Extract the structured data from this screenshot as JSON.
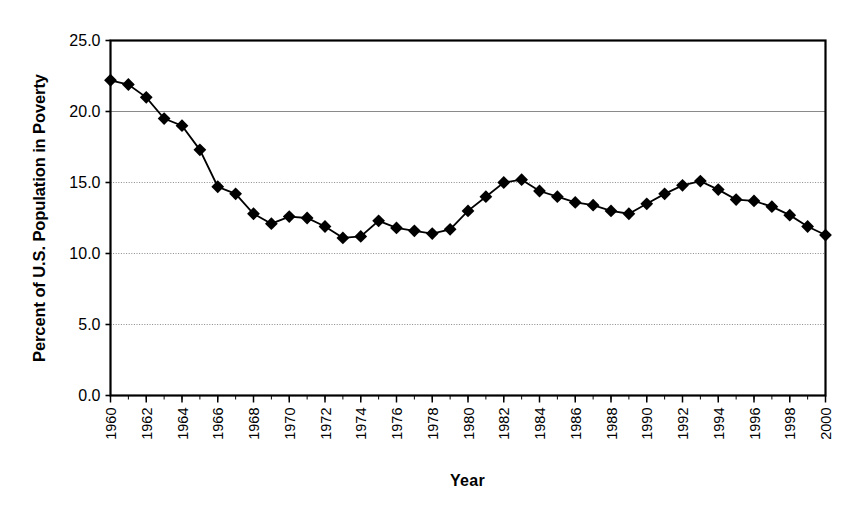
{
  "chart_data": {
    "type": "line",
    "title": "",
    "xlabel": "Year",
    "ylabel": "Percent of U.S. Population in Poverty",
    "xlim": [
      1960,
      2000
    ],
    "ylim": [
      0.0,
      25.0
    ],
    "ytick_labels": [
      "0.0",
      "5.0",
      "10.0",
      "15.0",
      "20.0",
      "25.0"
    ],
    "ytick_values": [
      0.0,
      5.0,
      10.0,
      15.0,
      20.0,
      25.0
    ],
    "xtick_labels": [
      "1960",
      "1962",
      "1964",
      "1966",
      "1968",
      "1970",
      "1972",
      "1974",
      "1976",
      "1978",
      "1980",
      "1982",
      "1984",
      "1986",
      "1988",
      "1990",
      "1992",
      "1994",
      "1996",
      "1998",
      "2000"
    ],
    "xtick_label_rotation": -90,
    "minor_xticks_every": 1,
    "grid": "horizontal",
    "legend": "none",
    "marker": "diamond",
    "marker_color": "#000000",
    "line_color": "#000000",
    "x": [
      1960,
      1961,
      1962,
      1963,
      1964,
      1965,
      1966,
      1967,
      1968,
      1969,
      1970,
      1971,
      1972,
      1973,
      1974,
      1975,
      1976,
      1977,
      1978,
      1979,
      1980,
      1981,
      1982,
      1983,
      1984,
      1985,
      1986,
      1987,
      1988,
      1989,
      1990,
      1991,
      1992,
      1993,
      1994,
      1995,
      1996,
      1997,
      1998,
      1999,
      2000
    ],
    "values": [
      22.2,
      21.9,
      21.0,
      19.5,
      19.0,
      17.3,
      14.7,
      14.2,
      12.8,
      12.1,
      12.6,
      12.5,
      11.9,
      11.1,
      11.2,
      12.3,
      11.8,
      11.6,
      11.4,
      11.7,
      13.0,
      14.0,
      15.0,
      15.2,
      14.4,
      14.0,
      13.6,
      13.4,
      13.0,
      12.8,
      13.5,
      14.2,
      14.8,
      15.1,
      14.5,
      13.8,
      13.7,
      13.3,
      12.7,
      11.9,
      11.3
    ]
  }
}
